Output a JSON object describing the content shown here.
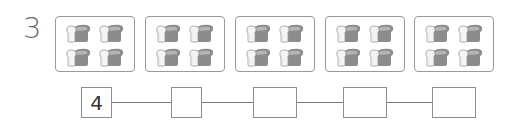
{
  "problem": {
    "number": "3"
  },
  "groups": [
    {
      "count": 4,
      "icon": "bread-loaf-icon"
    },
    {
      "count": 4,
      "icon": "bread-loaf-icon"
    },
    {
      "count": 4,
      "icon": "bread-loaf-icon"
    },
    {
      "count": 4,
      "icon": "bread-loaf-icon"
    },
    {
      "count": 4,
      "icon": "bread-loaf-icon"
    }
  ],
  "chain": {
    "boxes": [
      {
        "value": "4"
      },
      {
        "value": ""
      },
      {
        "value": ""
      },
      {
        "value": ""
      },
      {
        "value": ""
      }
    ]
  },
  "colors": {
    "border": "#9a9a9a",
    "text": "#6b6b6b",
    "bread_light": "#f2f2f2",
    "bread_dark": "#8a8a8a"
  }
}
